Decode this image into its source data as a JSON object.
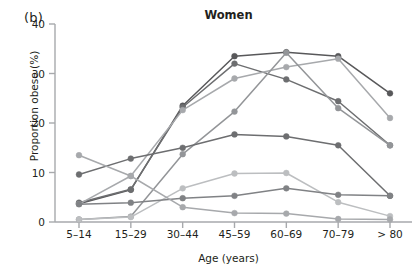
{
  "panel_label": "(b)",
  "axis": {
    "ylabel": "Proportion obese (%)",
    "xlabel": "Age (years)",
    "yticks": [
      "0",
      "10",
      "20",
      "30",
      "40"
    ],
    "ymin": 0,
    "ymax": 40
  },
  "colors": {
    "dark": "#58585a",
    "mid_dark": "#6d6e70",
    "mid": "#808285",
    "mid_light": "#939598",
    "light": "#a7a9ac",
    "lighter": "#bcbec0",
    "pale": "#d1d3d4",
    "axis": "#a7a9ac"
  },
  "chart_data": {
    "type": "line",
    "title": "Women",
    "xlabel": "Age (years)",
    "ylabel": "Proportion obese (%)",
    "ylim": [
      0,
      40
    ],
    "grid": false,
    "legend": "none",
    "markers": true,
    "categories": [
      "5–14",
      "15–29",
      "30–44",
      "45–59",
      "60–69",
      "70–79",
      "> 80"
    ],
    "series": [
      {
        "name": "series-1",
        "color": "#58585a",
        "values": [
          3.7,
          6.5,
          23.5,
          33.5,
          34.3,
          33.5,
          26.0
        ]
      },
      {
        "name": "series-2",
        "color": "#6d6e70",
        "values": [
          3.9,
          6.6,
          23.2,
          32.0,
          28.8,
          24.4,
          15.5
        ]
      },
      {
        "name": "series-3",
        "color": "#a7a9ac",
        "values": [
          3.6,
          9.3,
          22.6,
          29.0,
          31.3,
          33.0,
          21.0
        ]
      },
      {
        "name": "series-4",
        "color": "#939598",
        "values": [
          0.5,
          1.1,
          13.7,
          22.3,
          34.2,
          23.0,
          15.5
        ]
      },
      {
        "name": "series-5",
        "color": "#6d6e70",
        "values": [
          9.6,
          12.8,
          15.0,
          17.7,
          17.3,
          15.5,
          5.3
        ]
      },
      {
        "name": "series-6",
        "color": "#bcbec0",
        "values": [
          0.5,
          1.0,
          6.8,
          9.8,
          9.9,
          4.0,
          1.2
        ]
      },
      {
        "name": "series-7",
        "color": "#808285",
        "values": [
          3.6,
          3.9,
          4.8,
          5.3,
          6.8,
          5.5,
          5.3
        ]
      },
      {
        "name": "series-8",
        "color": "#a7a9ac",
        "values": [
          13.5,
          9.3,
          3.0,
          1.8,
          1.7,
          0.6,
          0.5
        ]
      }
    ]
  }
}
